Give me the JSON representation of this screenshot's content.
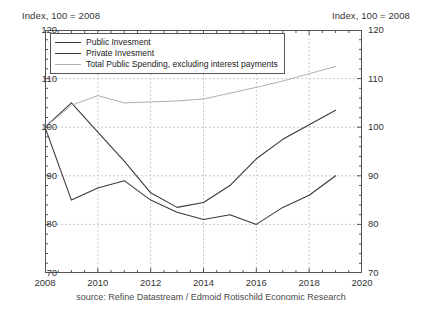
{
  "header": {
    "left_label": "Index, 100 = 2008",
    "right_label": "Index, 100 = 2008"
  },
  "source": {
    "text": "source: Refine Datastream / Edmoid Rotischild Economic Research"
  },
  "legend": {
    "entries": [
      {
        "label": "Public Invesment",
        "color": "#3a3a3a"
      },
      {
        "label": "Private Invesment",
        "color": "#3a3a3a"
      },
      {
        "label": "Total Public Spending, excluding interest payments",
        "color": "#b0b0b0"
      }
    ]
  },
  "axes": {
    "y_ticks": [
      "70",
      "80",
      "90",
      "100",
      "110",
      "120"
    ],
    "x_ticks": [
      "2008",
      "2010",
      "2012",
      "2014",
      "2016",
      "2018",
      "2020"
    ]
  },
  "chart_data": {
    "type": "line",
    "title": "",
    "subtitle": "",
    "xlabel": "",
    "ylabel": "Index, 100 = 2008",
    "xlim": [
      2008,
      2020
    ],
    "ylim": [
      70,
      120
    ],
    "grid": true,
    "legend_position": "top-left",
    "x": [
      2008,
      2009,
      2010,
      2011,
      2012,
      2013,
      2014,
      2015,
      2016,
      2017,
      2018,
      2019
    ],
    "series": [
      {
        "name": "Public Invesment",
        "color": "#3a3a3a",
        "values": [
          100,
          85,
          87.5,
          89,
          85,
          82.5,
          81,
          82,
          80,
          83.5,
          86,
          90
        ]
      },
      {
        "name": "Private Invesment",
        "color": "#3a3a3a",
        "values": [
          100,
          105,
          99,
          93,
          86.5,
          83.5,
          84.5,
          88,
          93.5,
          97.5,
          100.5,
          103.5
        ]
      },
      {
        "name": "Total Public Spending, excluding interest payments",
        "color": "#b0b0b0",
        "values": [
          100,
          104.5,
          106.5,
          105,
          105.2,
          105.4,
          105.8,
          107,
          108.2,
          109.5,
          111,
          112.5
        ]
      }
    ]
  },
  "style": {
    "axis_color": "#555555",
    "grid_color": "#c9c9c9",
    "background": "#ffffff"
  }
}
